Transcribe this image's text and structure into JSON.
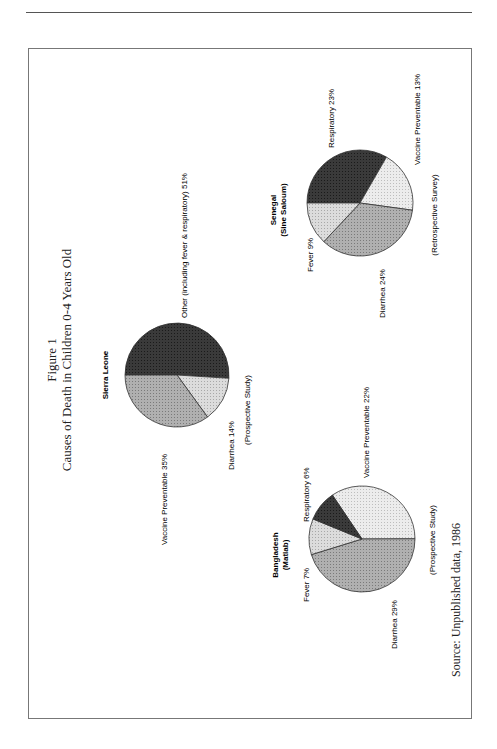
{
  "figure": {
    "label": "Figure 1",
    "title": "Causes of Death in Children 0-4 Years Old",
    "source": "Source: Unpublished data, 1986",
    "orientation": "rotated 90° counter-clockwise (landscape on portrait page)"
  },
  "colors": {
    "dark": "#2e2e2e",
    "medium": "#a9a9a9",
    "light": "#d9d9d9",
    "lighter": "#e9e9e9",
    "outline": "#333333"
  },
  "chart_data": [
    {
      "type": "pie",
      "title": "Sierra Leone",
      "subtitle": "",
      "note": "(Prospective Study)",
      "labels": [
        "Other (including fever & respiratory)",
        "Diarrhea",
        "Vaccine Preventable"
      ],
      "values": [
        51,
        14,
        35
      ],
      "label_text": [
        "Other (including fever & respiratory)  51%",
        "Diarrhea  14%",
        "Vaccine Preventable  35%"
      ],
      "shades": [
        "dark",
        "light",
        "medium"
      ]
    },
    {
      "type": "pie",
      "title": "Bangladesh",
      "subtitle": "(Matlab)",
      "note": "(Prospective Study)",
      "labels": [
        "Vaccine Preventable",
        "Diarrhea",
        "Fever",
        "Respiratory"
      ],
      "values": [
        22,
        29,
        7,
        6
      ],
      "label_text": [
        "Vaccine Preventable  22%",
        "Diarrhea  29%",
        "Fever  7%",
        "Respiratory  6%"
      ],
      "shades": [
        "lighter",
        "medium",
        "light",
        "dark"
      ],
      "displayed_share_note": "Slices drawn proportionally to visible wedge sizes"
    },
    {
      "type": "pie",
      "title": "Senegal",
      "subtitle": "(Sine Saloum)",
      "note": "(Retrospective Survey)",
      "labels": [
        "Respiratory",
        "Vaccine Preventable",
        "Diarrhea",
        "Fever"
      ],
      "values": [
        23,
        13,
        24,
        9
      ],
      "label_text": [
        "Respiratory  23%",
        "Vaccine Preventable  13%",
        "Diarrhea  24%",
        "Fever  9%"
      ],
      "shades": [
        "dark",
        "lighter",
        "medium",
        "light"
      ]
    }
  ]
}
